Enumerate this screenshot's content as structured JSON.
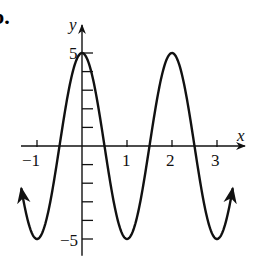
{
  "problem_label": "b.",
  "chart_data": {
    "type": "line",
    "title": "",
    "function": "y = 5cos(πx)",
    "xlabel": "x",
    "ylabel": "y",
    "x_ticks": [
      -1,
      0,
      1,
      2,
      3
    ],
    "x_tick_labels": [
      "−1",
      "1",
      "2",
      "3"
    ],
    "y_ticks": [
      -5,
      -4,
      -3,
      -2,
      -1,
      0,
      1,
      2,
      3,
      4,
      5
    ],
    "y_tick_labels": [
      "5",
      "−5"
    ],
    "xlim": [
      -1.4,
      3.6
    ],
    "ylim": [
      -5.8,
      6.4
    ],
    "grid": false,
    "legend": "none",
    "series": [
      {
        "name": "curve",
        "x_range": [
          -1.35,
          3.35
        ],
        "amplitude": 5,
        "period": 2,
        "points": [
          [
            -1.35,
            -2.94
          ],
          [
            -1,
            -5
          ],
          [
            -0.5,
            0
          ],
          [
            0,
            5
          ],
          [
            0.5,
            0
          ],
          [
            1,
            -5
          ],
          [
            1.5,
            0
          ],
          [
            2,
            5
          ],
          [
            2.5,
            0
          ],
          [
            3,
            -5
          ],
          [
            3.35,
            -2.94
          ]
        ],
        "arrow_ends": true
      }
    ]
  },
  "colors": {
    "ink": "#111111",
    "background": "#ffffff"
  }
}
